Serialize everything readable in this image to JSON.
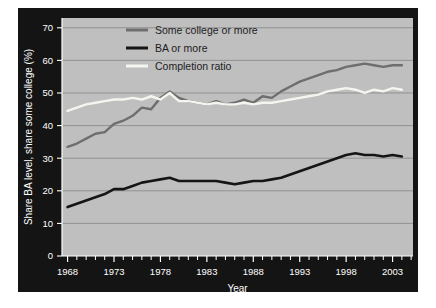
{
  "chart_data": {
    "type": "line",
    "title": "",
    "xlabel": "Year",
    "ylabel": "Share BA level, share some college (%)",
    "xlim": [
      1967.4,
      2005.2
    ],
    "ylim": [
      0,
      73
    ],
    "yticks": [
      0,
      10,
      20,
      30,
      40,
      50,
      60,
      70
    ],
    "ytick_labels": [
      "0",
      "10",
      "20",
      "30",
      "40",
      "50",
      "60",
      "70"
    ],
    "xticks": [
      1968,
      1973,
      1978,
      1983,
      1988,
      1993,
      1998,
      2003
    ],
    "xtick_labels": [
      "1968",
      "1973",
      "1978",
      "1983",
      "1988",
      "1993",
      "1998",
      "2003"
    ],
    "xtick_minor_step": 1,
    "grid": "horizontal",
    "grid_color": "#8c8c8c",
    "plot_background": "#bfbfbf",
    "panel_background": "#141414",
    "legend_position": "top-center",
    "x": [
      1968,
      1969,
      1970,
      1971,
      1972,
      1973,
      1974,
      1975,
      1976,
      1977,
      1978,
      1979,
      1980,
      1981,
      1982,
      1983,
      1984,
      1985,
      1986,
      1987,
      1988,
      1989,
      1990,
      1991,
      1992,
      1993,
      1994,
      1995,
      1996,
      1997,
      1998,
      1999,
      2000,
      2001,
      2002,
      2003,
      2004
    ],
    "series": [
      {
        "name": "Some college or more",
        "color": "#6e6e6e",
        "line_width": 2.4,
        "values": [
          33.5,
          34.5,
          36.0,
          37.5,
          38.0,
          40.5,
          41.5,
          43.0,
          45.5,
          45.0,
          48.5,
          50.5,
          48.5,
          47.5,
          47.0,
          46.5,
          47.5,
          46.5,
          47.0,
          48.0,
          47.0,
          49.0,
          48.5,
          50.5,
          52.0,
          53.5,
          54.5,
          55.5,
          56.5,
          57.0,
          58.0,
          58.5,
          59.0,
          58.5,
          58.0,
          58.5,
          58.5
        ]
      },
      {
        "name": "BA or more",
        "color": "#151515",
        "line_width": 2.6,
        "values": [
          15.0,
          16.0,
          17.0,
          18.0,
          19.0,
          20.5,
          20.5,
          21.5,
          22.5,
          23.0,
          23.5,
          24.0,
          23.0,
          23.0,
          23.0,
          23.0,
          23.0,
          22.5,
          22.0,
          22.5,
          23.0,
          23.0,
          23.5,
          24.0,
          25.0,
          26.0,
          27.0,
          28.0,
          29.0,
          30.0,
          31.0,
          31.5,
          31.0,
          31.0,
          30.5,
          31.0,
          30.5
        ]
      },
      {
        "name": "Completion ratio",
        "color": "#f5f5f0",
        "line_width": 2.4,
        "values": [
          44.5,
          45.5,
          46.5,
          47.0,
          47.5,
          48.0,
          48.0,
          48.5,
          48.0,
          49.0,
          48.0,
          50.0,
          47.5,
          47.5,
          47.0,
          46.5,
          47.0,
          46.5,
          46.5,
          47.0,
          46.5,
          47.0,
          47.0,
          47.5,
          48.0,
          48.5,
          49.0,
          49.5,
          50.5,
          51.0,
          51.5,
          51.0,
          50.0,
          51.0,
          50.5,
          51.5,
          51.0
        ]
      }
    ]
  },
  "legend": {
    "items": [
      {
        "label": "Some college or more",
        "color": "#6e6e6e"
      },
      {
        "label": "BA or more",
        "color": "#151515"
      },
      {
        "label": "Completion ratio",
        "color": "#f5f5f0"
      }
    ]
  }
}
